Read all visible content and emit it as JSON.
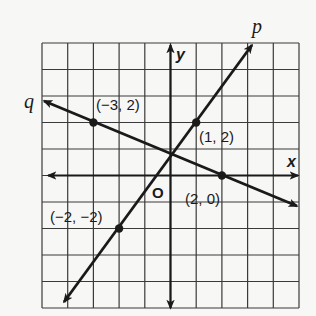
{
  "figure": {
    "grid": {
      "x_min": -5,
      "x_max": 5,
      "y_min": -5,
      "y_max": 5,
      "step": 1
    },
    "axes": {
      "x_label": "x",
      "y_label": "y",
      "origin_label": "O"
    },
    "lines": [
      {
        "name": "p",
        "label": "p",
        "through": [
          [
            -2,
            -2
          ],
          [
            1,
            2
          ]
        ],
        "slope": "4/3",
        "equation": "y = (4/3)x + 2/3"
      },
      {
        "name": "q",
        "label": "q",
        "through": [
          [
            -3,
            2
          ],
          [
            2,
            0
          ]
        ],
        "slope": "-2/5",
        "equation": "y = (-2/5)x + 4/5"
      }
    ],
    "points": [
      {
        "label": "(-3, 2)",
        "display": "(−3, 2)",
        "x": -3,
        "y": 2,
        "line": "q"
      },
      {
        "label": "(2, 0)",
        "display": "(2, 0)",
        "x": 2,
        "y": 0,
        "line": "q"
      },
      {
        "label": "(1, 2)",
        "display": "(1, 2)",
        "x": 1,
        "y": 2,
        "line": "p"
      },
      {
        "label": "(-2, -2)",
        "display": "(−2, −2)",
        "x": -2,
        "y": -2,
        "line": "p"
      }
    ],
    "colors": {
      "ink": "#1a1a1a",
      "grid": "#3a3a3a",
      "paper": "#f7f7f5"
    }
  }
}
